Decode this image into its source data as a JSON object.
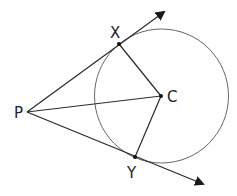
{
  "diagram": {
    "colors": {
      "stroke": "#2a2a2a",
      "circle": "#666666",
      "background": "#ffffff"
    },
    "circle": {
      "center": "C",
      "cx": 161.5,
      "cy": 96,
      "r": 67
    },
    "points": {
      "P": {
        "label": "P",
        "x": 27,
        "y": 112
      },
      "X": {
        "label": "X",
        "x": 119,
        "y": 44
      },
      "C": {
        "label": "C",
        "x": 161,
        "y": 96
      },
      "Y": {
        "label": "Y",
        "x": 135,
        "y": 157
      }
    },
    "segments": [
      {
        "from": "P",
        "to": "C"
      },
      {
        "from": "X",
        "to": "C"
      },
      {
        "from": "Y",
        "to": "C"
      }
    ],
    "rays": [
      {
        "from": "P",
        "through": "X",
        "arrow_tip": {
          "x": 164,
          "y": 12
        }
      },
      {
        "from": "P",
        "through": "Y",
        "arrow_tip": {
          "x": 203,
          "y": 184
        }
      }
    ]
  }
}
